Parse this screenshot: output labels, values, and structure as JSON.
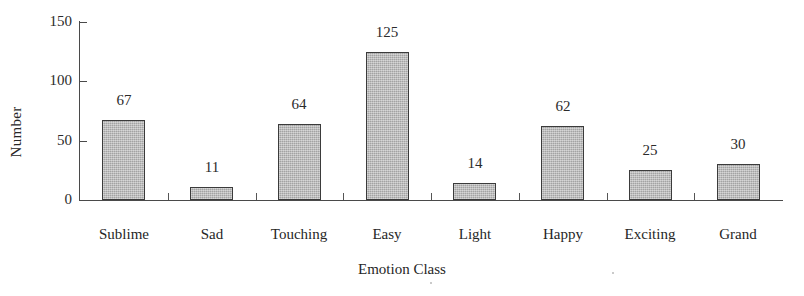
{
  "chart_data": {
    "type": "bar",
    "title": "",
    "xlabel": "Emotion Class",
    "ylabel": "Number",
    "categories": [
      "Sublime",
      "Sad",
      "Touching",
      "Easy",
      "Light",
      "Happy",
      "Exciting",
      "Grand"
    ],
    "values": [
      67,
      11,
      64,
      125,
      14,
      62,
      25,
      30
    ],
    "value_labels": [
      "67",
      "11",
      "64",
      "125",
      "14",
      "62",
      "25",
      "30"
    ],
    "ylim": [
      0,
      150
    ],
    "yticks": [
      0,
      50,
      100,
      150
    ],
    "ytick_labels": [
      "0",
      "50",
      "100",
      "150"
    ],
    "grid": false,
    "legend": false,
    "legend_position": "none",
    "bar_fill_color": "#b3b3b3",
    "bar_border_color": "#3b3b3b",
    "axis_color": "#4a4a4a",
    "text_color": "#262626",
    "background_color": "#ffffff"
  }
}
